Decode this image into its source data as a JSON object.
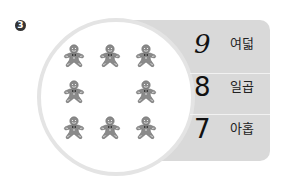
{
  "question": {
    "number_label": "3"
  },
  "circle": {
    "icon": "gingerbread-man-icon",
    "count": 8,
    "layout": "3x3 grid with center empty"
  },
  "choices": [
    {
      "number": "9",
      "word": "여덟"
    },
    {
      "number": "8",
      "word": "일곱"
    },
    {
      "number": "7",
      "word": "아홉"
    }
  ],
  "colors": {
    "panel": "#d9d9d9",
    "circle_border": "#e4e4e4",
    "cookie": "#8a8a8a"
  }
}
